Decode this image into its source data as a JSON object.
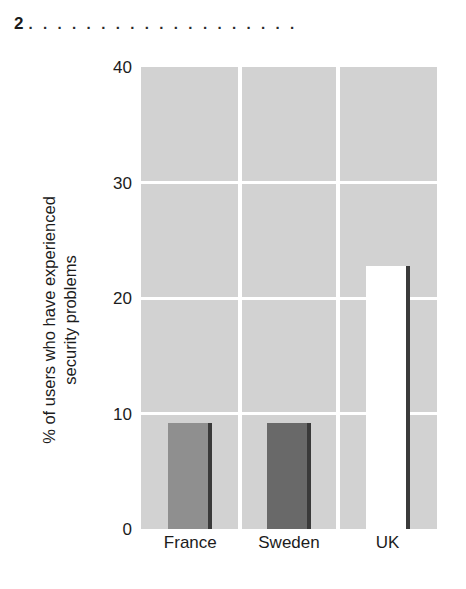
{
  "caption": {
    "number": "2",
    "leader": ". . . . . . . . . . . . . . . . . . ."
  },
  "chart_data": {
    "type": "bar",
    "title": "",
    "subtitle": "",
    "xlabel": "",
    "ylabel": "% of users who have experienced\nsecurity problems",
    "categories": [
      "France",
      "Sweden",
      "UK"
    ],
    "values": [
      9.2,
      9.2,
      22.8
    ],
    "series": [
      {
        "name": "% of users who have experienced security problems",
        "values": [
          9.2,
          9.2,
          22.8
        ]
      }
    ],
    "ylim": [
      0,
      40
    ],
    "ytick_labels": [
      "0",
      "10",
      "20",
      "30",
      "40"
    ],
    "ytick_values": [
      0,
      10,
      20,
      30,
      40
    ],
    "grid": "horizontal-and-vertical-white-on-gray",
    "legend": "none",
    "bar_colors": [
      "#8f8f8f",
      "#696969",
      "#ffffff"
    ],
    "bar_edge_color": "#3a3a3a",
    "plot_background": "#d2d2d2",
    "gridline_color": "#ffffff",
    "text_color": "#1c1c1c"
  }
}
